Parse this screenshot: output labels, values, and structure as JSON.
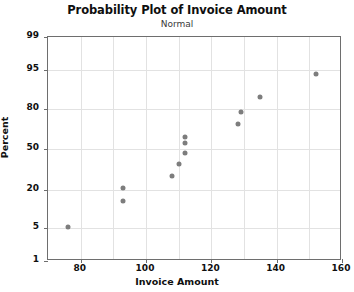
{
  "chart_data": {
    "type": "scatter",
    "title": "Probability Plot of Invoice Amount",
    "subtitle": "Normal",
    "xlabel": "Invoice Amount",
    "ylabel": "Percent",
    "grid": true,
    "legend": "none",
    "xlim": [
      70,
      160
    ],
    "ylim_percent": [
      1,
      99
    ],
    "yscale": "normal-probability",
    "xticks": [
      80,
      100,
      120,
      140,
      160
    ],
    "yticks": [
      1,
      5,
      20,
      50,
      80,
      95,
      99
    ],
    "x": [
      76,
      93,
      93,
      108,
      110,
      112,
      112,
      112,
      128,
      129,
      135,
      152
    ],
    "y_percent": [
      5.2,
      14.0,
      21.0,
      29.0,
      38.0,
      47.0,
      55.0,
      60.0,
      70.0,
      78.0,
      86.0,
      94.0
    ],
    "points": [
      {
        "x": 76,
        "percent": 5.2
      },
      {
        "x": 93,
        "percent": 14.0
      },
      {
        "x": 93,
        "percent": 21.0
      },
      {
        "x": 108,
        "percent": 29.0
      },
      {
        "x": 110,
        "percent": 38.0
      },
      {
        "x": 112,
        "percent": 47.0
      },
      {
        "x": 112,
        "percent": 55.0
      },
      {
        "x": 112,
        "percent": 60.0
      },
      {
        "x": 128,
        "percent": 70.0
      },
      {
        "x": 129,
        "percent": 78.0
      },
      {
        "x": 135,
        "percent": 86.0
      },
      {
        "x": 152,
        "percent": 94.0
      }
    ],
    "marker_color": "#7d7d7d",
    "grid_color": "#e2e2e2",
    "axis_color": "#6e6e6e"
  }
}
